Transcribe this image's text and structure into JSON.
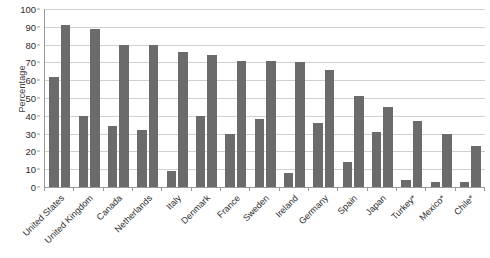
{
  "chart_data": {
    "type": "bar",
    "title": "",
    "subtitle": "",
    "xlabel": "",
    "ylabel": "Percentage",
    "ylim": [
      0,
      100
    ],
    "yticks": [
      0,
      10,
      20,
      30,
      40,
      50,
      60,
      70,
      80,
      90,
      100
    ],
    "grid": true,
    "legend": "none",
    "categories": [
      "United States",
      "United Kingdom",
      "Canada",
      "Netherlands",
      "Italy",
      "Denmark",
      "France",
      "Sweden",
      "Ireland",
      "Germany",
      "Spain",
      "Japan",
      "Turkey*",
      "Mexico*",
      "Chile*"
    ],
    "series": [
      {
        "name": "Series 1",
        "color": "#6b6b6b",
        "values": [
          62,
          40,
          34,
          32,
          9,
          40,
          30,
          38,
          8,
          36,
          14,
          31,
          4,
          3,
          3
        ]
      },
      {
        "name": "Series 2",
        "color": "#6b6b6b",
        "values": [
          91,
          89,
          80,
          80,
          76,
          74,
          71,
          71,
          70,
          66,
          51,
          45,
          37,
          30,
          23
        ]
      }
    ]
  },
  "axis": {
    "y_title": "Percentage"
  }
}
